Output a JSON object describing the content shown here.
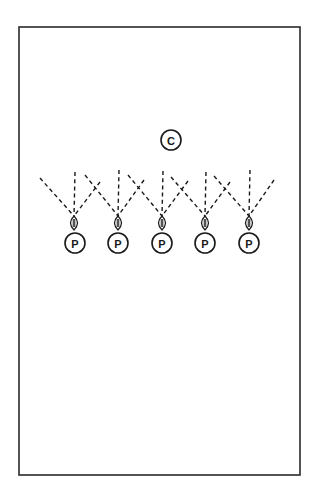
{
  "diagram": {
    "colors": {
      "line": "#1a1a1a",
      "border": "#2a2a2a",
      "background": "#ffffff"
    },
    "field": {
      "x": 19,
      "y": 27,
      "width": 281,
      "height": 448
    },
    "coach": {
      "label": "C",
      "cx": 171,
      "cy": 140,
      "r": 10
    },
    "players": [
      {
        "label": "P",
        "cx": 75,
        "cy": 243,
        "ball": {
          "cx": 74,
          "cy": 223
        },
        "routes": [
          {
            "x1": 40,
            "y1": 178
          },
          {
            "x1": 75,
            "y1": 172
          },
          {
            "x1": 100,
            "y1": 182
          }
        ]
      },
      {
        "label": "P",
        "cx": 118,
        "cy": 243,
        "ball": {
          "cx": 118,
          "cy": 223
        },
        "routes": [
          {
            "x1": 85,
            "y1": 175
          },
          {
            "x1": 119,
            "y1": 170
          },
          {
            "x1": 144,
            "y1": 180
          }
        ]
      },
      {
        "label": "P",
        "cx": 162,
        "cy": 243,
        "ball": {
          "cx": 162,
          "cy": 223
        },
        "routes": [
          {
            "x1": 128,
            "y1": 175
          },
          {
            "x1": 163,
            "y1": 171
          },
          {
            "x1": 188,
            "y1": 181
          }
        ]
      },
      {
        "label": "P",
        "cx": 205,
        "cy": 243,
        "ball": {
          "cx": 205,
          "cy": 223
        },
        "routes": [
          {
            "x1": 171,
            "y1": 177
          },
          {
            "x1": 206,
            "y1": 172
          },
          {
            "x1": 230,
            "y1": 182
          }
        ]
      },
      {
        "label": "P",
        "cx": 249,
        "cy": 243,
        "ball": {
          "cx": 249,
          "cy": 223
        },
        "routes": [
          {
            "x1": 214,
            "y1": 176
          },
          {
            "x1": 250,
            "y1": 170
          },
          {
            "x1": 274,
            "y1": 180
          }
        ]
      }
    ]
  }
}
